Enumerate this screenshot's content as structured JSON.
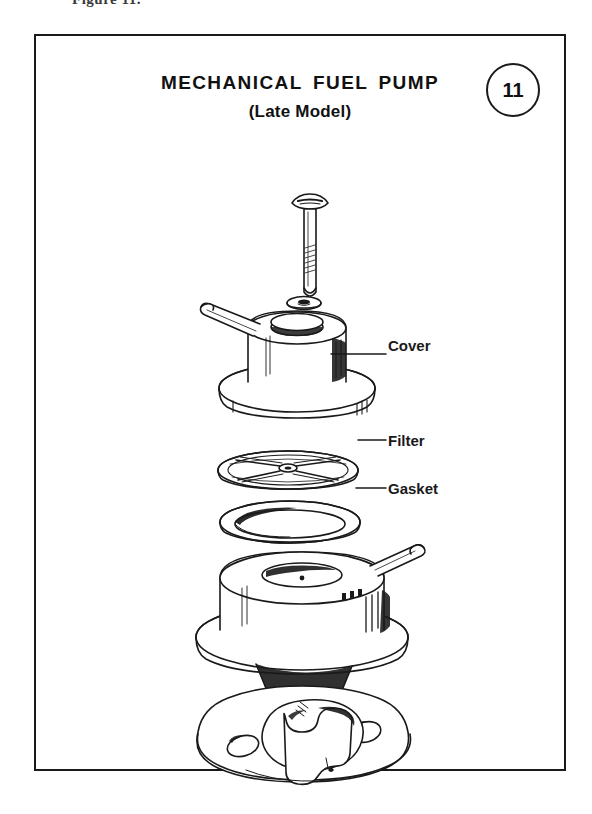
{
  "page": {
    "caption": "Figure 11."
  },
  "figure": {
    "title": "MECHANICAL FUEL PUMP",
    "subtitle": "(Late Model)",
    "badge_number": "11",
    "ink_color": "#1a1a1a",
    "paper_color": "#ffffff"
  },
  "callouts": [
    {
      "label": "Cover",
      "part": "pump-cover"
    },
    {
      "label": "Filter",
      "part": "fuel-filter-screen"
    },
    {
      "label": "Gasket",
      "part": "cover-gasket"
    }
  ],
  "exploded_parts": [
    {
      "name": "cover-screw",
      "order": 1,
      "labeled": false
    },
    {
      "name": "screw-washer",
      "order": 2,
      "labeled": false
    },
    {
      "name": "pump-cover",
      "order": 3,
      "labeled": true,
      "label": "Cover"
    },
    {
      "name": "fuel-filter-screen",
      "order": 4,
      "labeled": true,
      "label": "Filter"
    },
    {
      "name": "cover-gasket",
      "order": 5,
      "labeled": true,
      "label": "Gasket"
    },
    {
      "name": "pump-body",
      "order": 6,
      "labeled": false
    },
    {
      "name": "mounting-flange-rocker-arm",
      "order": 7,
      "labeled": false
    }
  ]
}
